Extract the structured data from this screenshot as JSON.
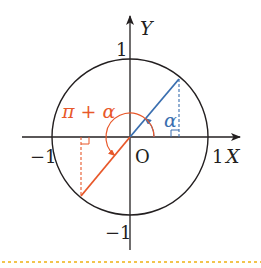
{
  "diagram": {
    "axes": {
      "x_label": "X",
      "y_label": "Y",
      "origin_label": "O",
      "ticks": {
        "x_pos": "1",
        "x_neg": "−1",
        "y_pos": "1",
        "y_neg": "−1"
      }
    },
    "angles": {
      "alpha_label": "α",
      "pi_plus_alpha_label": "π + α"
    },
    "colors": {
      "axis": "#231f20",
      "circle": "#231f20",
      "alpha_ray": "#3a6fb0",
      "pi_plus_alpha_ray": "#e8582a",
      "divider": "#f2c44d"
    }
  }
}
